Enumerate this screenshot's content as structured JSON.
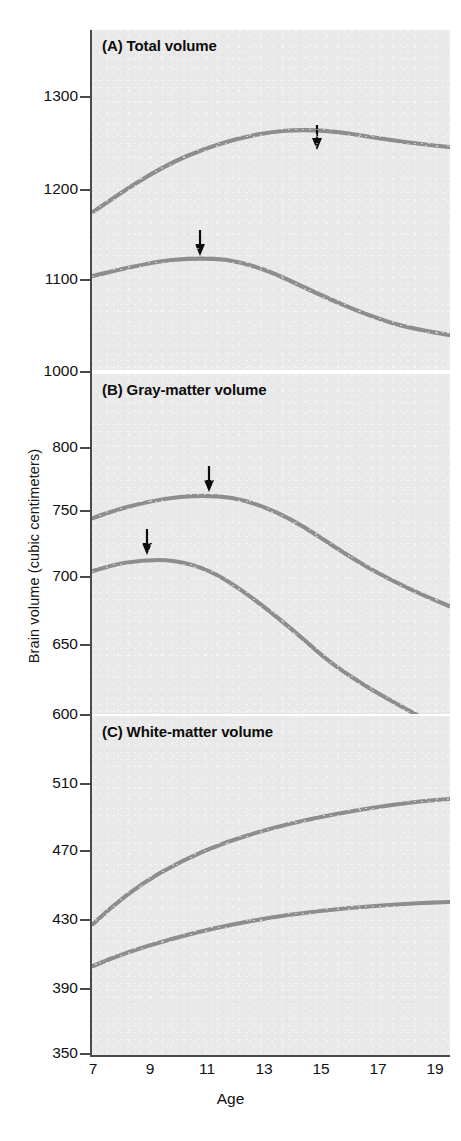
{
  "figure": {
    "y_axis_title": "Brain volume (cubic centimeters)",
    "x_axis_title": "Age"
  },
  "panels": [
    {
      "id": "A",
      "title": "(A) Total volume"
    },
    {
      "id": "B",
      "title": "(B) Gray-matter volume"
    },
    {
      "id": "C",
      "title": "(C) White-matter volume"
    }
  ],
  "chart_data": [
    {
      "type": "line",
      "title": "(A) Total volume",
      "xlabel": "Age",
      "ylabel": "Brain volume (cubic centimeters)",
      "xlim": [
        7,
        19
      ],
      "ylim": [
        1000,
        1340
      ],
      "yticks": [
        1000,
        1100,
        1200,
        1300
      ],
      "xticks": [
        7,
        9,
        11,
        13,
        15,
        17,
        19
      ],
      "grid": false,
      "legend": "none",
      "x": [
        7,
        8,
        9,
        10,
        11,
        12,
        13,
        14,
        15,
        16,
        17,
        18,
        19
      ],
      "series": [
        {
          "name": "upper curve",
          "values": [
            1182,
            1196,
            1209,
            1220,
            1229,
            1237,
            1243,
            1247,
            1248,
            1247,
            1245,
            1242,
            1240
          ]
        },
        {
          "name": "lower curve",
          "values": [
            1113,
            1120,
            1125,
            1128,
            1128,
            1126,
            1122,
            1116,
            1109,
            1101,
            1094,
            1087,
            1082
          ]
        }
      ],
      "annotations": [
        {
          "marker": "down-arrow",
          "series": "upper curve",
          "x": 14.7,
          "y": 1248
        },
        {
          "marker": "down-arrow",
          "series": "lower curve",
          "x": 10.7,
          "y": 1128
        }
      ]
    },
    {
      "type": "line",
      "title": "(B) Gray-matter volume",
      "xlabel": "Age",
      "ylabel": "Brain volume (cubic centimeters)",
      "xlim": [
        7,
        19
      ],
      "ylim": [
        600,
        855
      ],
      "yticks": [
        600,
        650,
        700,
        750,
        800
      ],
      "xticks": [
        7,
        9,
        11,
        13,
        15,
        17,
        19
      ],
      "grid": false,
      "legend": "none",
      "x": [
        7,
        8,
        9,
        10,
        11,
        12,
        13,
        14,
        15,
        16,
        17,
        18,
        19
      ],
      "series": [
        {
          "name": "upper curve",
          "values": [
            762,
            768,
            772,
            775,
            775,
            774,
            771,
            766,
            760,
            753,
            746,
            740,
            735
          ]
        },
        {
          "name": "lower curve",
          "values": [
            722,
            727,
            728,
            727,
            724,
            719,
            712,
            703,
            693,
            682,
            670,
            658,
            647
          ]
        }
      ],
      "annotations": [
        {
          "marker": "down-arrow",
          "series": "upper curve",
          "x": 11.0,
          "y": 775
        },
        {
          "marker": "down-arrow",
          "series": "lower curve",
          "x": 8.9,
          "y": 728
        }
      ]
    },
    {
      "type": "line",
      "title": "(C) White-matter volume",
      "xlabel": "Age",
      "ylabel": "Brain volume (cubic centimeters)",
      "xlim": [
        7,
        19
      ],
      "ylim": [
        350,
        555
      ],
      "yticks": [
        350,
        390,
        430,
        470,
        510
      ],
      "xticks": [
        7,
        9,
        11,
        13,
        15,
        17,
        19
      ],
      "grid": false,
      "legend": "none",
      "x": [
        7,
        8,
        9,
        10,
        11,
        12,
        13,
        14,
        15,
        16,
        17,
        18,
        19
      ],
      "series": [
        {
          "name": "upper curve",
          "values": [
            410,
            424,
            436,
            447,
            457,
            466,
            474,
            480,
            486,
            490,
            494,
            496,
            498
          ]
        },
        {
          "name": "lower curve",
          "values": [
            385,
            392,
            398,
            404,
            409,
            414,
            419,
            423,
            426,
            429,
            431,
            432,
            433
          ]
        }
      ],
      "annotations": []
    }
  ],
  "y_ticks": [
    {
      "label": "1300",
      "top": 89
    },
    {
      "label": "1200",
      "top": 182
    },
    {
      "label": "1100",
      "top": 272
    },
    {
      "label": "1000",
      "top": 364
    },
    {
      "label": "800",
      "top": 440
    },
    {
      "label": "750",
      "top": 503
    },
    {
      "label": "700",
      "top": 569
    },
    {
      "label": "650",
      "top": 637
    },
    {
      "label": "600",
      "top": 707
    },
    {
      "label": "510",
      "top": 776
    },
    {
      "label": "470",
      "top": 843
    },
    {
      "label": "430",
      "top": 912
    },
    {
      "label": "390",
      "top": 981
    },
    {
      "label": "350",
      "top": 1046
    }
  ],
  "x_ticks": [
    {
      "label": "7",
      "left": 93
    },
    {
      "label": "9",
      "left": 150
    },
    {
      "label": "11",
      "left": 207
    },
    {
      "label": "13",
      "left": 264
    },
    {
      "label": "15",
      "left": 321
    },
    {
      "label": "17",
      "left": 378
    },
    {
      "label": "19",
      "left": 435
    }
  ],
  "colors": {
    "curve": "#8d8d8d",
    "plot_background": "#e9e9e9",
    "axis": "#4a4a4a",
    "text": "#111111"
  }
}
